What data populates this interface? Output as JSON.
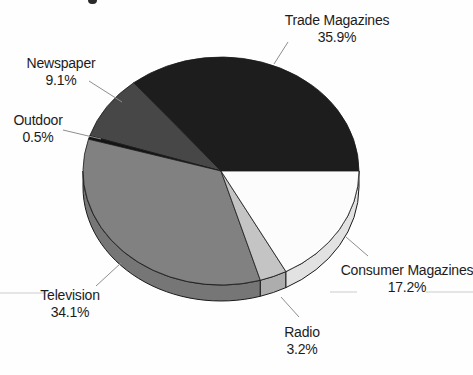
{
  "chart_data": {
    "type": "pie",
    "style": "3d",
    "title": "",
    "start_angle_deg": 0,
    "direction": "counterclockwise",
    "unit": "percent",
    "slices": [
      {
        "label": "Trade Magazines",
        "value": 35.9,
        "display": "35.9%",
        "color": "#1d1d1d",
        "side_color": "#1d1d1d"
      },
      {
        "label": "Newspaper",
        "value": 9.1,
        "display": "9.1%",
        "color": "#474747",
        "side_color": "#474747"
      },
      {
        "label": "Outdoor",
        "value": 0.5,
        "display": "0.5%",
        "color": "#141414",
        "side_color": "#141414"
      },
      {
        "label": "Television",
        "value": 34.1,
        "display": "34.1%",
        "color": "#818181",
        "side_color": "#767676"
      },
      {
        "label": "Radio",
        "value": 3.2,
        "display": "3.2%",
        "color": "#c4c4c4",
        "side_color": "#adadad"
      },
      {
        "label": "Consumer Magazines",
        "value": 17.2,
        "display": "17.2%",
        "color": "#fcfcfc",
        "side_color": "#e2e2e2"
      }
    ],
    "outline_color": "#1a1a1a",
    "leader_line_color": "#8e8e8e"
  }
}
